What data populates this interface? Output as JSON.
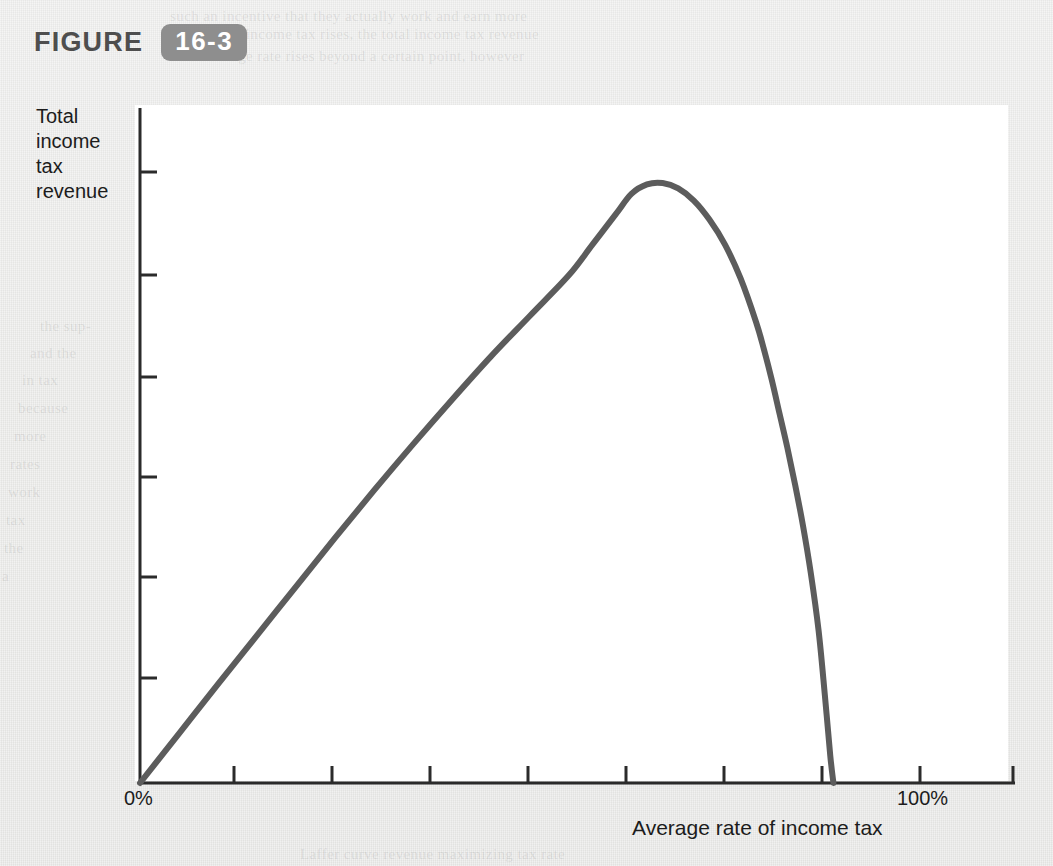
{
  "figure": {
    "word": "FIGURE",
    "number": "16-3"
  },
  "axes": {
    "y_label_lines": [
      "Total",
      "income",
      "tax",
      "revenue"
    ],
    "x_label": "Average rate of income tax",
    "x_tick_labels": {
      "origin": "0%",
      "max": "100%"
    }
  },
  "colors": {
    "page_background": "#e9e9e7",
    "plate_background": "#ffffff",
    "badge_background": "#8e8e8e",
    "badge_text": "#ffffff",
    "figure_word": "#4e4e4e",
    "curve": "#5c5c5c",
    "axis": "#2b2b2b",
    "text": "#1c1c1c"
  },
  "ghost_text": [
    {
      "x": 170,
      "y": 8,
      "text": "such an incentive that they actually work and earn more"
    },
    {
      "x": 200,
      "y": 26,
      "text": "rate of income tax rises, the total income tax revenue"
    },
    {
      "x": 180,
      "y": 48,
      "text": "the average rate rises beyond a certain point, however"
    },
    {
      "x": 330,
      "y": 116,
      "text": "economy and the total income tax revenue falls."
    },
    {
      "x": 340,
      "y": 140,
      "text": "relationship is shown in Figure 16-3. As the income"
    },
    {
      "x": 330,
      "y": 166,
      "text": "tax rate rises from zero, tax revenue rises. We follow"
    },
    {
      "x": 330,
      "y": 190,
      "text": "the curve upward until the tax rate reaches the point"
    },
    {
      "x": 310,
      "y": 300,
      "text": "where revenue is a maximum. Beyond that point"
    },
    {
      "x": 300,
      "y": 325,
      "text": "increases in the tax rate actually decrease tax"
    },
    {
      "x": 290,
      "y": 350,
      "text": "revenue. This relationship is called the Laffer"
    },
    {
      "x": 300,
      "y": 375,
      "text": "curve, after economist Arthur Laffer who drew"
    },
    {
      "x": 310,
      "y": 400,
      "text": "this curve on a restaurant napkin in 1974."
    },
    {
      "x": 320,
      "y": 430,
      "text": "Most economists believe that the United States"
    },
    {
      "x": 330,
      "y": 455,
      "text": "is on the upward-sloping part of the Laffer"
    },
    {
      "x": 350,
      "y": 480,
      "text": "curve, so that a tax rate increase would"
    },
    {
      "x": 380,
      "y": 505,
      "text": "raise revenue, not lower it."
    },
    {
      "x": 400,
      "y": 535,
      "text": "However, some economists"
    },
    {
      "x": 390,
      "y": 560,
      "text": "argue that high marginal"
    },
    {
      "x": 380,
      "y": 585,
      "text": "tax rates do reduce the"
    },
    {
      "x": 390,
      "y": 610,
      "text": "incentive to work."
    },
    {
      "x": 40,
      "y": 318,
      "text": "the sup-"
    },
    {
      "x": 30,
      "y": 345,
      "text": "and the"
    },
    {
      "x": 22,
      "y": 372,
      "text": "in tax"
    },
    {
      "x": 18,
      "y": 400,
      "text": "because"
    },
    {
      "x": 14,
      "y": 428,
      "text": "more"
    },
    {
      "x": 10,
      "y": 456,
      "text": "rates"
    },
    {
      "x": 8,
      "y": 484,
      "text": "work"
    },
    {
      "x": 6,
      "y": 512,
      "text": "tax"
    },
    {
      "x": 4,
      "y": 540,
      "text": "the"
    },
    {
      "x": 2,
      "y": 568,
      "text": "a"
    },
    {
      "x": 300,
      "y": 846,
      "text": "Laffer curve revenue maximizing tax rate"
    }
  ],
  "chart_data": {
    "type": "line",
    "title": "",
    "subtitle": "",
    "xlabel": "Average rate of income tax",
    "ylabel": "Total income tax revenue",
    "xlim": [
      0,
      110
    ],
    "ylim": [
      0,
      110
    ],
    "grid": false,
    "legend": "none",
    "x_tick_values": [
      0,
      10,
      20,
      30,
      40,
      50,
      60,
      70,
      80,
      90,
      100
    ],
    "x_tick_text": [
      "0%",
      "",
      "",
      "",
      "",
      "",
      "",
      "",
      "",
      "",
      "100%"
    ],
    "y_tick_count": 6,
    "y_tick_values": [
      15,
      30,
      45,
      60,
      75,
      90
    ],
    "annotations": [
      {
        "label": "revenue maximum (peak of Laffer curve)",
        "x": 63,
        "y": 88.5
      },
      {
        "label": "revenue returns to zero at 100% tax rate",
        "x": 86,
        "y": 0
      }
    ],
    "series": [
      {
        "name": "Laffer curve",
        "color": "#5c5c5c",
        "points": [
          [
            0,
            0
          ],
          [
            5,
            7.3
          ],
          [
            10,
            14.6
          ],
          [
            15,
            21.8
          ],
          [
            20,
            29.0
          ],
          [
            25,
            36.2
          ],
          [
            30,
            43.2
          ],
          [
            35,
            50.0
          ],
          [
            40,
            56.6
          ],
          [
            45,
            63.0
          ],
          [
            50,
            69.0
          ],
          [
            55,
            75.0
          ],
          [
            58,
            79.5
          ],
          [
            61,
            84.0
          ],
          [
            63,
            87.0
          ],
          [
            65,
            88.4
          ],
          [
            67,
            88.6
          ],
          [
            69,
            87.8
          ],
          [
            71,
            86.0
          ],
          [
            73,
            83.2
          ],
          [
            75,
            79.5
          ],
          [
            77,
            74.5
          ],
          [
            79,
            68.0
          ],
          [
            80,
            64.0
          ],
          [
            81,
            59.5
          ],
          [
            82,
            54.5
          ],
          [
            83,
            49.5
          ],
          [
            84,
            44.0
          ],
          [
            85,
            38.0
          ],
          [
            86,
            31.0
          ],
          [
            87,
            22.5
          ],
          [
            87.8,
            13.0
          ],
          [
            88.5,
            4.0
          ],
          [
            88.9,
            0
          ]
        ]
      }
    ]
  },
  "geometry": {
    "plate": {
      "x": 135,
      "y": 105,
      "w": 873,
      "h": 676
    },
    "origin": {
      "x": 140,
      "y": 783
    },
    "x_axis_end": {
      "x": 1015,
      "y": 783
    },
    "y_axis_top": {
      "x": 140,
      "y": 108
    },
    "x_tick_positions": [
      234,
      332,
      430,
      528,
      626,
      724,
      822,
      920,
      1013
    ],
    "y_tick_positions": [
      172,
      275,
      377,
      477,
      577,
      678
    ],
    "curve_peak": {
      "x": 738,
      "y": 183
    },
    "curve_zero_cross": {
      "x": 955,
      "y": 783
    }
  }
}
